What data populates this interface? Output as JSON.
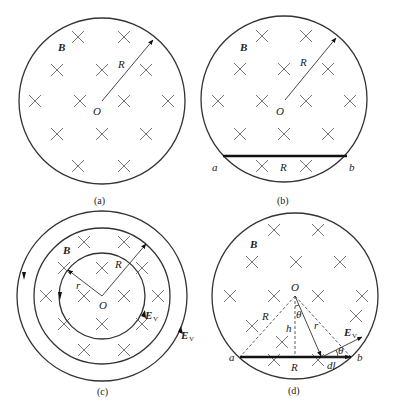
{
  "panels": [
    {
      "id": "a",
      "caption": "(a)",
      "field_label": "B",
      "center_label": "O",
      "radius_label": "R",
      "center": [
        102,
        101
      ],
      "radius": 83,
      "crosses": [
        [
          78,
          37
        ],
        [
          124,
          37
        ],
        [
          57,
          70
        ],
        [
          102,
          70
        ],
        [
          146,
          70
        ],
        [
          35,
          101
        ],
        [
          80,
          101
        ],
        [
          124,
          101
        ],
        [
          168,
          101
        ],
        [
          57,
          134
        ],
        [
          102,
          134
        ],
        [
          146,
          134
        ],
        [
          78,
          166
        ],
        [
          124,
          166
        ]
      ]
    },
    {
      "id": "b",
      "caption": "(b)",
      "field_label": "B",
      "center_label": "O",
      "radius_label": "R",
      "chord_label": "R",
      "endpoint_a": "a",
      "endpoint_b": "b",
      "center": [
        284,
        99
      ],
      "radius": 83,
      "crosses": [
        [
          262,
          36
        ],
        [
          306,
          36
        ],
        [
          240,
          69
        ],
        [
          284,
          69
        ],
        [
          328,
          69
        ],
        [
          218,
          101
        ],
        [
          262,
          101
        ],
        [
          306,
          101
        ],
        [
          350,
          101
        ],
        [
          240,
          134
        ],
        [
          284,
          134
        ],
        [
          328,
          134
        ],
        [
          262,
          166
        ],
        [
          306,
          166
        ]
      ]
    },
    {
      "id": "c",
      "caption": "(c)",
      "field_label": "B",
      "center_label": "O",
      "radius_label": "R",
      "inner_radius_label": "r",
      "field_vector_label_inner": "E",
      "field_vector_label_outer": "E",
      "field_vector_subscript": "V",
      "center": [
        102,
        296
      ],
      "radii": [
        43,
        68,
        85
      ],
      "crosses": [
        [
          84,
          242
        ],
        [
          124,
          242
        ],
        [
          64,
          268
        ],
        [
          102,
          268
        ],
        [
          142,
          268
        ],
        [
          46,
          296
        ],
        [
          84,
          296
        ],
        [
          124,
          296
        ],
        [
          158,
          296
        ],
        [
          64,
          324
        ],
        [
          102,
          324
        ],
        [
          142,
          324
        ],
        [
          84,
          350
        ],
        [
          124,
          350
        ]
      ]
    },
    {
      "id": "d",
      "caption": "(d)",
      "field_label": "B",
      "center_label": "O",
      "radius_label": "R",
      "chord_label": "R",
      "height_label": "h",
      "distance_label": "r",
      "angle_label": "θ",
      "element_label": "dl",
      "field_vector_label": "E",
      "field_vector_subscript": "V",
      "endpoint_a": "a",
      "endpoint_b": "b",
      "center": [
        295,
        296
      ],
      "radius": 83,
      "crosses": [
        [
          274,
          230
        ],
        [
          318,
          230
        ],
        [
          252,
          262
        ],
        [
          296,
          262
        ],
        [
          340,
          262
        ],
        [
          230,
          296
        ],
        [
          274,
          296
        ],
        [
          318,
          296
        ],
        [
          362,
          296
        ],
        [
          252,
          326
        ],
        [
          356,
          316
        ],
        [
          282,
          342
        ],
        [
          274,
          360
        ],
        [
          318,
          360
        ]
      ]
    }
  ]
}
